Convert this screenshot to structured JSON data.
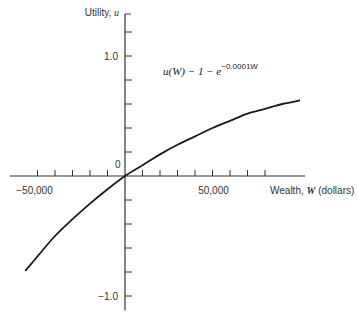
{
  "chart_data": {
    "type": "line",
    "title": "",
    "xlabel": "Wealth, W (dollars)",
    "xlabel_parts": {
      "pre": "Wealth, ",
      "var": "W",
      "post": " (dollars)"
    },
    "ylabel": "Utility, u",
    "ylabel_parts": {
      "pre": "Utility, ",
      "var": "u"
    },
    "xlim": [
      -65000,
      100000
    ],
    "ylim": [
      -1.2,
      1.3
    ],
    "x_tick_step": 10000,
    "y_tick_step": 0.2,
    "x_tick_labels": [
      {
        "value": -50000,
        "label": "−50,000"
      },
      {
        "value": 50000,
        "label": "50,000"
      }
    ],
    "y_tick_labels": [
      {
        "value": 1.0,
        "label": "1.0"
      },
      {
        "value": -1.0,
        "label": "−1.0"
      }
    ],
    "origin_label": "0",
    "grid": false,
    "legend": "none",
    "annotation": {
      "text_main": "u(W) − 1 − e",
      "text_exponent": "−0.0001W",
      "anchor": {
        "x": 20000,
        "y": 0.65
      }
    },
    "series": [
      {
        "name": "u(W)",
        "x": [
          -57000,
          -50000,
          -40000,
          -30000,
          -20000,
          -10000,
          0,
          10000,
          20000,
          30000,
          40000,
          50000,
          60000,
          70000,
          80000,
          90000,
          100000
        ],
        "y": [
          -0.79,
          -0.67,
          -0.5,
          -0.36,
          -0.23,
          -0.11,
          0.0,
          0.09,
          0.18,
          0.26,
          0.33,
          0.4,
          0.46,
          0.52,
          0.56,
          0.6,
          0.63
        ]
      }
    ]
  }
}
